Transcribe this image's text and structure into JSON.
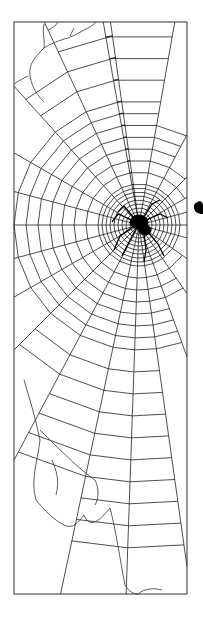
{
  "image": {
    "subject": "spider-on-web-line-drawing",
    "background_color": "#ffffff",
    "ink_color": "#1a1a1a",
    "frame": {
      "x": 14,
      "y": 22,
      "width": 173,
      "height": 572
    },
    "web_center": {
      "x": 139,
      "y": 225
    },
    "spider": {
      "x": 139,
      "y": 225,
      "color": "#000000"
    }
  }
}
